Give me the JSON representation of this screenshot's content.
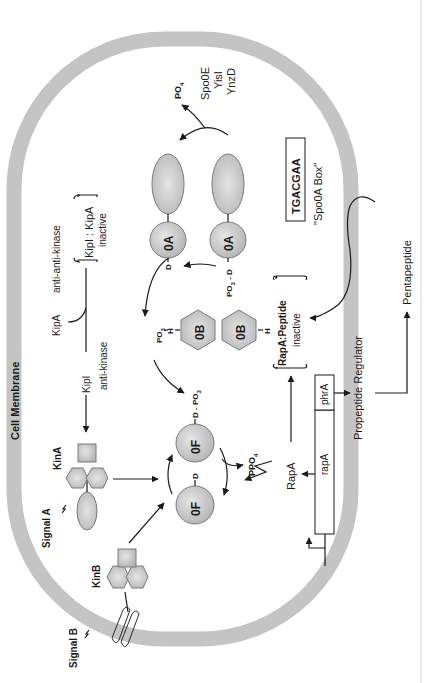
{
  "diagram": {
    "title": "Cell Membrane",
    "orientation": "rotated 90deg counter-clockwise",
    "colors": {
      "membrane": "#c4c4c4",
      "protein_fill": "#bdbdbd",
      "protein_highlight": "#e2e2e2",
      "line": "#1a1a1a",
      "frame_line": "#d0d0d0"
    },
    "signals": {
      "signal_a": "Signal A",
      "signal_b": "Signal B"
    },
    "kinases": {
      "kina": "KinA",
      "kinb": "KinB"
    },
    "regulators": {
      "kipi": "KipI",
      "kipi_role": "anti-kinase",
      "kipa": "KipA",
      "kipa_role": "anti-anti-kinase",
      "complex": "[KipI : KipA]",
      "complex_left": "KipI : KipA",
      "complex_state": "inactive"
    },
    "phosphorelay": {
      "of_label": "0F",
      "ob_label": "0B",
      "oa_label": "0A",
      "d": "D",
      "h": "H",
      "po3": "PO3",
      "po4": "PO4",
      "dash_d": "-D",
      "d_dash_po3": "D - PO",
      "po3_d": "PO",
      "po3_d_suffix": "- D",
      "sub3": "3",
      "sub4": "4"
    },
    "phosphatases": [
      "Spo0E",
      "YisI",
      "YnzD"
    ],
    "spo0a_box": {
      "sequence": "TGACGAA",
      "label": "\"Spo0A Box\""
    },
    "rap": {
      "protein": "RapA",
      "gene": "rapA",
      "complex": "RapA:Peptide",
      "complex_state": "inactive"
    },
    "phr": {
      "gene": "phrA",
      "product": "Propeptide Regulator",
      "mature": "Pentapeptide"
    }
  }
}
